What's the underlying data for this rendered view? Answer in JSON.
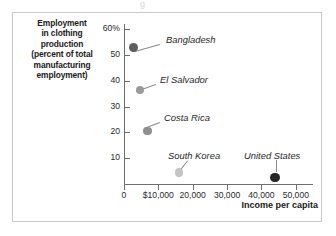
{
  "top_sliver_text": "g",
  "axes": {
    "y_title": "Employment in clothing production (percent of total manufacturing employment)",
    "y_title_lines": [
      "Employment",
      "in clothing",
      "production",
      "(percent of total",
      "manufacturing",
      "employment)"
    ],
    "x_title": "Income per capita",
    "y_ticks": [
      "60%",
      "50",
      "40",
      "30",
      "20",
      "10"
    ],
    "x_ticks": [
      "0",
      "$10,000",
      "20,000",
      "30,000",
      "40,000",
      "50,000"
    ]
  },
  "chart_data": {
    "type": "scatter",
    "title": "",
    "xlabel": "Income per capita",
    "ylabel": "Employment in clothing production (percent of total manufacturing employment)",
    "xlim": [
      0,
      55000
    ],
    "ylim": [
      0,
      62
    ],
    "grid": false,
    "legend": "none",
    "x_tick_values": [
      0,
      10000,
      20000,
      30000,
      40000,
      50000
    ],
    "x_tick_labels": [
      "0",
      "$10,000",
      "20,000",
      "30,000",
      "40,000",
      "50,000"
    ],
    "y_tick_values": [
      10,
      20,
      30,
      40,
      50,
      60
    ],
    "y_tick_labels": [
      "10",
      "20",
      "30",
      "40",
      "50",
      "60%"
    ],
    "points": [
      {
        "label": "Bangladesh",
        "x": 2800,
        "y": 53.0,
        "color": "#5e5e5e",
        "radius": 4.6,
        "label_x": 166,
        "label_y": 34,
        "leader_from_x": 160,
        "leader_from_y": 45,
        "leader_to_x": 135,
        "leader_to_y": 52
      },
      {
        "label": "El Salvador",
        "x": 4600,
        "y": 36.5,
        "color": "#9a9a9a",
        "radius": 4.2,
        "label_x": 160,
        "label_y": 74,
        "leader_from_x": 156,
        "leader_from_y": 85,
        "leader_to_x": 136,
        "leader_to_y": 92
      },
      {
        "label": "Costa Rica",
        "x": 6800,
        "y": 20.5,
        "color": "#8f8f8f",
        "radius": 4.2,
        "label_x": 164,
        "label_y": 112,
        "leader_from_x": 160,
        "leader_from_y": 123,
        "leader_to_x": 144,
        "leader_to_y": 129
      },
      {
        "label": "South Korea",
        "x": 16000,
        "y": 4.5,
        "color": "#c4c4c4",
        "radius": 4.4,
        "label_x": 168,
        "label_y": 150,
        "leader_from_x": 188,
        "leader_from_y": 161,
        "leader_to_x": 181,
        "leader_to_y": 170
      },
      {
        "label": "United States",
        "x": 44000,
        "y": 2.5,
        "color": "#262626",
        "radius": 4.8,
        "label_x": 244,
        "label_y": 150,
        "leader_from_x": 277,
        "leader_from_y": 160,
        "leader_to_x": 277,
        "leader_to_y": 172
      }
    ]
  }
}
